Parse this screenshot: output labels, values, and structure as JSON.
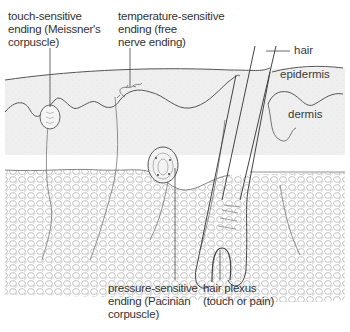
{
  "diagram": {
    "colors": {
      "background": "#ffffff",
      "epidermis_fill": "#ececec",
      "dermis_fill": "#f3f3f3",
      "line": "#555555",
      "text": "#333333"
    },
    "labels": {
      "meissner": {
        "line1": "touch-sensitive",
        "line2": "ending (Meissner's",
        "line3": "corpuscle)"
      },
      "free_nerve": {
        "line1": "temperature-sensitive",
        "line2": "ending (free",
        "line3": "nerve ending)"
      },
      "hair": "hair",
      "epidermis": "epidermis",
      "dermis": "dermis",
      "pacinian": {
        "line1": "pressure-sensitive",
        "line2": "ending (Pacinian",
        "line3": "corpuscle)"
      },
      "hair_plexus": {
        "line1": "hair plexus",
        "line2": "(touch or pain)"
      }
    }
  }
}
